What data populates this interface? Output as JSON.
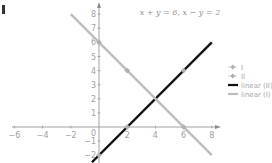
{
  "chart_data": {
    "type": "line",
    "title": "x + y = 6, x − y = 2",
    "xlabel": "",
    "ylabel": "",
    "xlim": [
      -6,
      8
    ],
    "ylim": [
      -2.5,
      8
    ],
    "x_ticks": [
      -6,
      -4,
      -2,
      2,
      4,
      6,
      8
    ],
    "y_ticks": [
      -2,
      -1,
      1,
      2,
      3,
      4,
      5,
      6,
      7,
      8
    ],
    "origin_label": "0",
    "grid": false,
    "legend_position": "right",
    "series": [
      {
        "name": "I",
        "kind": "markers",
        "color": "#b0b0b0",
        "points": [
          [
            0,
            6
          ],
          [
            2,
            4
          ],
          [
            6,
            0
          ]
        ]
      },
      {
        "name": "II",
        "kind": "markers",
        "color": "#b0b0b0",
        "points": [
          [
            0,
            -2
          ],
          [
            2,
            0
          ],
          [
            6,
            4
          ]
        ]
      },
      {
        "name": "linear (II)",
        "kind": "line",
        "color": "#111111",
        "equation": "y = x - 2",
        "points": [
          [
            -0.5,
            -2.5
          ],
          [
            8,
            6
          ]
        ]
      },
      {
        "name": "linear (I)",
        "kind": "line",
        "color": "#bdbdbd",
        "equation": "y = 6 - x",
        "points": [
          [
            -2,
            8
          ],
          [
            8,
            -2
          ]
        ]
      }
    ],
    "intersection": [
      4,
      2
    ]
  },
  "legend": {
    "items": [
      {
        "label": "I"
      },
      {
        "label": "II"
      },
      {
        "label": "linear (II)"
      },
      {
        "label": "linear (I)"
      }
    ]
  }
}
